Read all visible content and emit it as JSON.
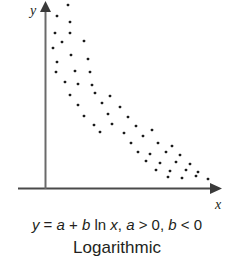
{
  "figure": {
    "background_color": "#ffffff",
    "ink_color": "#231f20"
  },
  "axes": {
    "y_label": "y",
    "x_label": "x",
    "y_axis_name": "vertical-axis",
    "x_axis_name": "horizontal-axis",
    "arrowheads": "both-axes"
  },
  "caption": {
    "equation_parts": {
      "y": "y",
      "eq": " = ",
      "a": "a",
      "plus": " + ",
      "b": "b",
      "ln": " ln ",
      "x": "x",
      "comma1": ", ",
      "a2": "a",
      "gt": " > 0, ",
      "b2": "b",
      "lt": " < 0"
    },
    "equation_plain": "y = a + b ln x, a > 0, b < 0",
    "model_name": "Logarithmic"
  },
  "chart_data": {
    "type": "scatter",
    "title": "Logarithmic",
    "subtitle": "y = a + b ln x, a > 0, b < 0",
    "xlabel": "x",
    "ylabel": "y",
    "grid": false,
    "legend": null,
    "axis_ranges": {
      "x_pixel": [
        45,
        215
      ],
      "y_pixel": [
        2,
        189
      ]
    },
    "marker": {
      "shape": "square-dot",
      "size_px": 2.6,
      "color": "#1a1a1a"
    },
    "points_pixel": [
      [
        68,
        5
      ],
      [
        57,
        16
      ],
      [
        70,
        22
      ],
      [
        55,
        33
      ],
      [
        70,
        33
      ],
      [
        62,
        42
      ],
      [
        84,
        41
      ],
      [
        53,
        48
      ],
      [
        71,
        55
      ],
      [
        57,
        62
      ],
      [
        88,
        59
      ],
      [
        56,
        72
      ],
      [
        75,
        71
      ],
      [
        90,
        72
      ],
      [
        65,
        82
      ],
      [
        78,
        84
      ],
      [
        92,
        85
      ],
      [
        70,
        95
      ],
      [
        95,
        93
      ],
      [
        110,
        96
      ],
      [
        78,
        105
      ],
      [
        102,
        103
      ],
      [
        120,
        107
      ],
      [
        84,
        116
      ],
      [
        108,
        114
      ],
      [
        128,
        117
      ],
      [
        94,
        125
      ],
      [
        112,
        124
      ],
      [
        136,
        126
      ],
      [
        152,
        130
      ],
      [
        100,
        132
      ],
      [
        124,
        133
      ],
      [
        143,
        136
      ],
      [
        131,
        143
      ],
      [
        158,
        143
      ],
      [
        172,
        146
      ],
      [
        138,
        152
      ],
      [
        150,
        154
      ],
      [
        166,
        152
      ],
      [
        180,
        155
      ],
      [
        146,
        161
      ],
      [
        160,
        163
      ],
      [
        176,
        162
      ],
      [
        190,
        164
      ],
      [
        156,
        170
      ],
      [
        170,
        171
      ],
      [
        186,
        170
      ],
      [
        198,
        172
      ],
      [
        168,
        177
      ],
      [
        182,
        178
      ],
      [
        196,
        176
      ],
      [
        208,
        179
      ]
    ]
  }
}
